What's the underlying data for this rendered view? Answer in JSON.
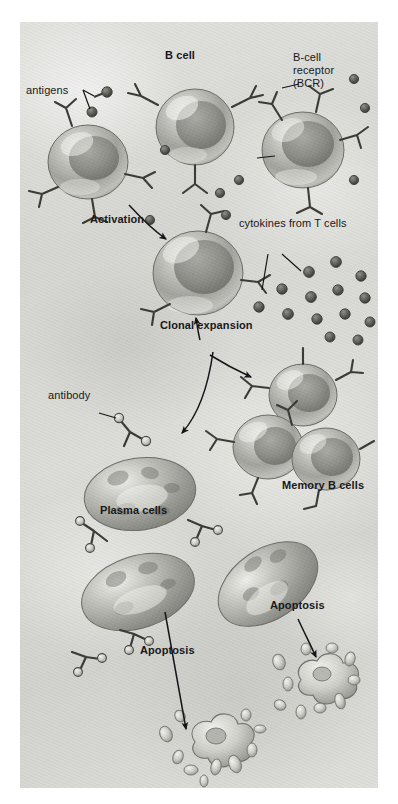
{
  "figure": {
    "background_color": "#d9d9d6",
    "ink_color": "#17171a",
    "cell_body_color": "#a9a9a4",
    "cell_nucleus_color": "#8d8d88",
    "canvas": {
      "x": 20,
      "y": 22,
      "width": 358,
      "height": 766
    }
  },
  "labels": {
    "antigens": "antigens",
    "b_cell": "B cell",
    "bcr_line1": "B-cell",
    "bcr_line2": "receptor",
    "bcr_line3": "(BCR)",
    "activation": "Activation",
    "cytokines": "cytokines from T cells",
    "clonal_expansion": "Clonal expansion",
    "antibody": "antibody",
    "memory_b_cells": "Memory B cells",
    "plasma_cells": "Plasma cells",
    "apoptosis_left": "Apoptosis",
    "apoptosis_right": "Apoptosis"
  },
  "stages": [
    {
      "name": "naive-b-cells",
      "label": "B cell",
      "count": 3
    },
    {
      "name": "activated-b-cell",
      "label": "Activation",
      "count": 1
    },
    {
      "name": "expanded-clone",
      "label": "Clonal expansion",
      "count": 4
    },
    {
      "name": "memory-b-cells",
      "label": "Memory B cells",
      "count": 3
    },
    {
      "name": "plasma-cells",
      "label": "Plasma cells",
      "count": 3
    },
    {
      "name": "apoptotic-debris",
      "label": "Apoptosis",
      "count": 2
    }
  ],
  "molecules": {
    "antigen_label": "antigens",
    "bcr_label": "B-cell receptor (BCR)",
    "antibody_label": "antibody",
    "cytokine_label": "cytokines from T cells",
    "cytokine_dot_count": 16
  }
}
